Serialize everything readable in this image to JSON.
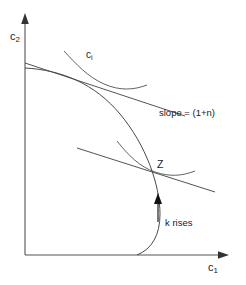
{
  "figure": {
    "background_color": "#ffffff",
    "line_color": "#4a4a4a",
    "axis_color": "#555555",
    "text_color": "#1a1a1a",
    "width": 246,
    "height": 285
  },
  "axes": {
    "y_label_base": "c",
    "y_label_sub": "2",
    "x_label_base": "c",
    "x_label_sub": "1",
    "origin": [
      25,
      255
    ],
    "x_axis_end": [
      228,
      255
    ],
    "y_axis_end": [
      25,
      14
    ]
  },
  "labels": {
    "top_curve_base": "c",
    "top_curve_sub": "i",
    "slope": "slope = (1+n)",
    "point_z": "Z",
    "k_rises": "k rises"
  },
  "chart_data": {
    "type": "line",
    "title": "",
    "xlabel": "c1",
    "ylabel": "c2",
    "grid": false,
    "legend": false,
    "annotations": [
      {
        "text": "ci",
        "x": 86,
        "y": 50
      },
      {
        "text": "slope = (1+n)",
        "x": 159,
        "y": 108
      },
      {
        "text": "Z",
        "x": 157,
        "y": 159
      },
      {
        "text": "k rises",
        "x": 165,
        "y": 218
      }
    ],
    "series": [
      {
        "name": "consumption-possibility-frontier",
        "kind": "curve",
        "path": "M 25,68 C 62,70 95,84 120,114 C 146,145 160,185 160,214 C 160,235 152,249 137,255"
      },
      {
        "name": "indifference-curve-upper",
        "kind": "curve",
        "path": "M 64,51 C 76,64 88,77 104,84 C 120,91 134,90 147,85"
      },
      {
        "name": "tangent-line-upper",
        "kind": "line",
        "path": "M 25,63 L 185,116"
      },
      {
        "name": "indifference-curve-lower",
        "kind": "curve",
        "path": "M 117,141 C 128,155 140,167 155,172 C 170,177 182,176 195,171"
      },
      {
        "name": "tangent-line-lower",
        "kind": "line",
        "path": "M 77,148 L 215,192"
      },
      {
        "name": "k-rises-arrow",
        "kind": "arrow",
        "path": "M 158,220 L 158,196"
      }
    ]
  }
}
